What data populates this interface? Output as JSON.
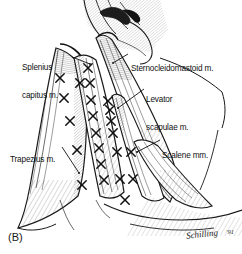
{
  "figure": {
    "caption": "(B)",
    "background_color": "#ffffff",
    "ink_color": "#1a1a1a",
    "signature": "Schilling",
    "signature_year": "'91"
  },
  "labels": [
    {
      "id": "splenius-capitus",
      "text_line1": "Splenius",
      "text_line2": "capitus m.",
      "x": 22,
      "y": 44,
      "leader": {
        "x1": 72,
        "y1": 57,
        "x2": 90,
        "y2": 64
      }
    },
    {
      "id": "sternocleidomastoid",
      "text_line1": "Sternocleidomastoid m.",
      "text_line2": "",
      "x": 131,
      "y": 45,
      "leader": {
        "x1": 128,
        "y1": 54,
        "x2": 113,
        "y2": 63
      }
    },
    {
      "id": "levator-scapulae",
      "text_line1": "Levator",
      "text_line2": "scapulae m.",
      "x": 146,
      "y": 76,
      "leader": {
        "x1": 144,
        "y1": 89,
        "x2": 118,
        "y2": 108
      }
    },
    {
      "id": "scalene",
      "text_line1": "Scalene mm.",
      "text_line2": "",
      "x": 162,
      "y": 132,
      "leader": {
        "x1": 160,
        "y1": 140,
        "x2": 137,
        "y2": 152
      }
    },
    {
      "id": "trapezius",
      "text_line1": "Trapezius m.",
      "text_line2": "",
      "x": 10,
      "y": 136,
      "leader": {
        "x1": 62,
        "y1": 147,
        "x2": 79,
        "y2": 173
      }
    }
  ],
  "trigger_points": [
    {
      "x": 60,
      "y": 78
    },
    {
      "x": 64,
      "y": 98
    },
    {
      "x": 70,
      "y": 121
    },
    {
      "x": 77,
      "y": 150
    },
    {
      "x": 82,
      "y": 185
    },
    {
      "x": 88,
      "y": 68
    },
    {
      "x": 80,
      "y": 83
    },
    {
      "x": 90,
      "y": 83
    },
    {
      "x": 91,
      "y": 100
    },
    {
      "x": 93,
      "y": 116
    },
    {
      "x": 96,
      "y": 133
    },
    {
      "x": 99,
      "y": 148
    },
    {
      "x": 101,
      "y": 164
    },
    {
      "x": 104,
      "y": 180
    },
    {
      "x": 108,
      "y": 101
    },
    {
      "x": 110,
      "y": 110
    },
    {
      "x": 111,
      "y": 121
    },
    {
      "x": 113,
      "y": 133
    },
    {
      "x": 117,
      "y": 152
    },
    {
      "x": 131,
      "y": 152
    },
    {
      "x": 120,
      "y": 179
    },
    {
      "x": 133,
      "y": 179
    },
    {
      "x": 125,
      "y": 200
    }
  ]
}
